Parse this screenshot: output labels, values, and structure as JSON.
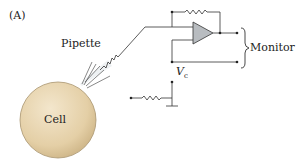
{
  "figure": {
    "panel_label": "(A)",
    "labels": {
      "pipette": "Pipette",
      "cell": "Cell",
      "monitor": "Monitor",
      "vc_main": "V",
      "vc_sub": "c"
    },
    "colors": {
      "cell_fill": "#e6d2ac",
      "cell_edge": "#9c8a6a",
      "opamp_fill": "#b8bcc0",
      "wire": "#333333",
      "pipette_fill": "#e8ecee"
    }
  }
}
